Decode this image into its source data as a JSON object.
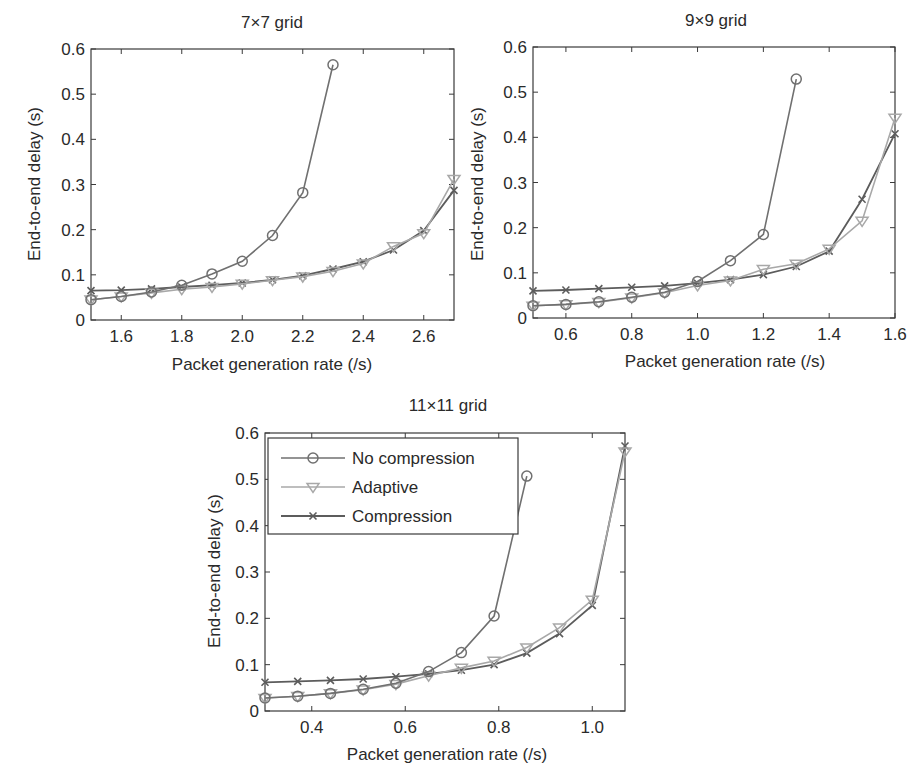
{
  "colors": {
    "no_compression": "#707070",
    "adaptive": "#a8a8a8",
    "compression": "#5c5c5c",
    "axis": "#3a3a3a"
  },
  "legend": {
    "entries": [
      {
        "label": "No compression",
        "marker": "circle"
      },
      {
        "label": "Adaptive",
        "marker": "triangle-down"
      },
      {
        "label": "Compression",
        "marker": "x"
      }
    ]
  },
  "chart_data": [
    {
      "type": "line",
      "title": "7×7 grid",
      "xlabel": "Packet generation rate (/s)",
      "ylabel": "End-to-end delay (s)",
      "xlim": [
        1.5,
        2.7
      ],
      "ylim": [
        0,
        0.6
      ],
      "xticks": [
        1.6,
        1.8,
        2.0,
        2.2,
        2.4,
        2.6
      ],
      "xtick_labels": [
        "1.6",
        "1.8",
        "2.0",
        "2.2",
        "2.4",
        "2.6"
      ],
      "yticks": [
        0,
        0.1,
        0.2,
        0.3,
        0.4,
        0.5,
        0.6
      ],
      "ytick_labels": [
        "0",
        "0.1",
        "0.2",
        "0.3",
        "0.4",
        "0.5",
        "0.6"
      ],
      "grid": false,
      "legend_position": "none",
      "series": [
        {
          "name": "No compression",
          "marker": "circle",
          "x": [
            1.5,
            1.6,
            1.7,
            1.8,
            1.9,
            2.0,
            2.1,
            2.2,
            2.3
          ],
          "values": [
            0.045,
            0.052,
            0.062,
            0.077,
            0.102,
            0.13,
            0.187,
            0.282,
            0.565
          ]
        },
        {
          "name": "Adaptive",
          "marker": "triangle-down",
          "x": [
            1.5,
            1.6,
            1.7,
            1.8,
            1.9,
            2.0,
            2.1,
            2.2,
            2.3,
            2.4,
            2.5,
            2.6,
            2.7
          ],
          "values": [
            0.045,
            0.052,
            0.06,
            0.068,
            0.073,
            0.08,
            0.088,
            0.096,
            0.108,
            0.125,
            0.163,
            0.192,
            0.312
          ]
        },
        {
          "name": "Compression",
          "marker": "x",
          "x": [
            1.5,
            1.6,
            1.7,
            1.8,
            1.9,
            2.0,
            2.1,
            2.2,
            2.3,
            2.4,
            2.5,
            2.6,
            2.7
          ],
          "values": [
            0.065,
            0.066,
            0.069,
            0.073,
            0.077,
            0.082,
            0.089,
            0.098,
            0.113,
            0.129,
            0.155,
            0.198,
            0.287
          ]
        }
      ]
    },
    {
      "type": "line",
      "title": "9×9 grid",
      "xlabel": "Packet generation rate (/s)",
      "ylabel": "End-to-end delay (s)",
      "xlim": [
        0.5,
        1.6
      ],
      "ylim": [
        0,
        0.6
      ],
      "xticks": [
        0.6,
        0.8,
        1.0,
        1.2,
        1.4,
        1.6
      ],
      "xtick_labels": [
        "0.6",
        "0.8",
        "1.0",
        "1.2",
        "1.4",
        "1.6"
      ],
      "yticks": [
        0,
        0.1,
        0.2,
        0.3,
        0.4,
        0.5,
        0.6
      ],
      "ytick_labels": [
        "0",
        "0.1",
        "0.2",
        "0.3",
        "0.4",
        "0.5",
        "0.6"
      ],
      "grid": false,
      "legend_position": "none",
      "series": [
        {
          "name": "No compression",
          "marker": "circle",
          "x": [
            0.5,
            0.6,
            0.7,
            0.8,
            0.9,
            1.0,
            1.1,
            1.2,
            1.3
          ],
          "values": [
            0.027,
            0.03,
            0.036,
            0.046,
            0.057,
            0.081,
            0.127,
            0.185,
            0.529
          ]
        },
        {
          "name": "Adaptive",
          "marker": "triangle-down",
          "x": [
            0.5,
            0.6,
            0.7,
            0.8,
            0.9,
            1.0,
            1.1,
            1.2,
            1.3,
            1.4,
            1.5,
            1.6
          ],
          "values": [
            0.027,
            0.03,
            0.035,
            0.045,
            0.056,
            0.072,
            0.083,
            0.108,
            0.12,
            0.153,
            0.215,
            0.443
          ]
        },
        {
          "name": "Compression",
          "marker": "x",
          "x": [
            0.5,
            0.6,
            0.7,
            0.8,
            0.9,
            1.0,
            1.1,
            1.2,
            1.3,
            1.4,
            1.5,
            1.6
          ],
          "values": [
            0.06,
            0.062,
            0.065,
            0.068,
            0.071,
            0.077,
            0.085,
            0.096,
            0.114,
            0.148,
            0.263,
            0.408
          ]
        }
      ]
    },
    {
      "type": "line",
      "title": "11×11 grid",
      "xlabel": "Packet generation rate (/s)",
      "ylabel": "End-to-end delay (s)",
      "xlim": [
        0.3,
        1.07
      ],
      "ylim": [
        0,
        0.6
      ],
      "xticks": [
        0.4,
        0.6,
        0.8,
        1.0
      ],
      "xtick_labels": [
        "0.4",
        "0.6",
        "0.8",
        "1.0"
      ],
      "yticks": [
        0,
        0.1,
        0.2,
        0.3,
        0.4,
        0.5,
        0.6
      ],
      "ytick_labels": [
        "0",
        "0.1",
        "0.2",
        "0.3",
        "0.4",
        "0.5",
        "0.6"
      ],
      "grid": false,
      "legend_position": "upper left",
      "series": [
        {
          "name": "No compression",
          "marker": "circle",
          "x": [
            0.3,
            0.37,
            0.44,
            0.51,
            0.58,
            0.65,
            0.72,
            0.79,
            0.86
          ],
          "values": [
            0.028,
            0.032,
            0.038,
            0.047,
            0.06,
            0.085,
            0.126,
            0.205,
            0.507
          ]
        },
        {
          "name": "Adaptive",
          "marker": "triangle-down",
          "x": [
            0.3,
            0.37,
            0.44,
            0.51,
            0.58,
            0.65,
            0.72,
            0.79,
            0.86,
            0.93,
            1.0,
            1.07
          ],
          "values": [
            0.028,
            0.032,
            0.038,
            0.046,
            0.058,
            0.076,
            0.093,
            0.108,
            0.137,
            0.18,
            0.24,
            0.56
          ]
        },
        {
          "name": "Compression",
          "marker": "x",
          "x": [
            0.3,
            0.37,
            0.44,
            0.51,
            0.58,
            0.65,
            0.72,
            0.79,
            0.86,
            0.93,
            1.0,
            1.07
          ],
          "values": [
            0.062,
            0.064,
            0.066,
            0.069,
            0.074,
            0.08,
            0.088,
            0.1,
            0.125,
            0.167,
            0.228,
            0.572
          ]
        }
      ]
    }
  ]
}
